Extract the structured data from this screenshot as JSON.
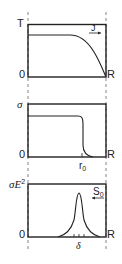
{
  "diagram": {
    "dashed_guides": {
      "left_x": 28,
      "right_x": 106,
      "color": "#555555"
    },
    "panels": [
      {
        "id": "temperature",
        "y_label": "T",
        "origin_label": "0",
        "x_end_label": "R",
        "arrow_label": "J",
        "arrow_direction": "right",
        "curve": "flat plateau then falls to zero at R"
      },
      {
        "id": "conductivity",
        "y_label": "σ",
        "origin_label": "0",
        "x_end_label": "R",
        "tick_label": "r",
        "tick_label_sub": "0",
        "curve": "flat plateau then sharp drop at r0"
      },
      {
        "id": "dissipation",
        "y_label": "σE",
        "y_label_sup": "2",
        "origin_label": "0",
        "x_end_label": "R",
        "tick_label": "δ",
        "arrow_label": "S",
        "arrow_label_sub": "0",
        "arrow_direction": "left",
        "curve": "narrow peak centered near r0 with width δ"
      }
    ]
  }
}
